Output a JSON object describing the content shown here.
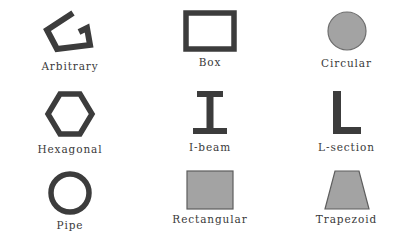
{
  "figure": {
    "background_color": "#ffffff",
    "grid": {
      "rows": 3,
      "columns": 3
    },
    "colors": {
      "outline": "#3c3c3c",
      "fill_gray": "#a3a3a3",
      "label_text": "#3a3a3a",
      "background": "#ffffff"
    }
  },
  "shapes": [
    {
      "id": "arbitrary",
      "label": "Arbitrary",
      "style": "outline",
      "description": "open irregular polygonal chevron outline",
      "row": 1,
      "column": 1
    },
    {
      "id": "box",
      "label": "Box",
      "style": "outline",
      "description": "hollow rectangular box section",
      "row": 1,
      "column": 2
    },
    {
      "id": "circular",
      "label": "Circular",
      "style": "filled",
      "description": "solid filled circle",
      "row": 1,
      "column": 3
    },
    {
      "id": "hexagonal",
      "label": "Hexagonal",
      "style": "outline",
      "description": "hollow hexagon with flat top and bottom",
      "row": 2,
      "column": 1
    },
    {
      "id": "i-beam",
      "label": "I-beam",
      "style": "filled",
      "description": "I shaped beam with top and bottom flanges and vertical web",
      "row": 2,
      "column": 2
    },
    {
      "id": "l-section",
      "label": "L-section",
      "style": "filled",
      "description": "L shaped angle section",
      "row": 2,
      "column": 3
    },
    {
      "id": "pipe",
      "label": "Pipe",
      "style": "outline",
      "description": "hollow circular ring annulus",
      "row": 3,
      "column": 1
    },
    {
      "id": "rectangular",
      "label": "Rectangular",
      "style": "filled",
      "description": "solid filled rectangle",
      "row": 3,
      "column": 2
    },
    {
      "id": "trapezoid",
      "label": "Trapezoid",
      "style": "filled",
      "description": "solid filled trapezoid, narrow top wide bottom",
      "row": 3,
      "column": 3
    }
  ]
}
